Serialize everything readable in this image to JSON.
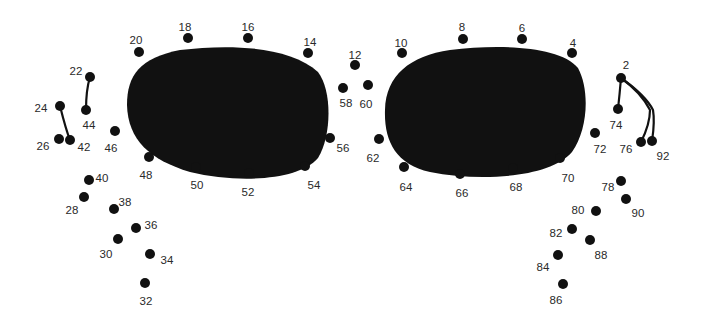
{
  "puzzle": {
    "type": "connect-the-dots",
    "colors": {
      "background": "#ffffff",
      "ink": "#111111",
      "label": "#2a2a2a"
    },
    "lenses": [
      {
        "name": "left-lens",
        "path": "M 180 50 C 230 44, 290 46, 318 72 C 332 90, 332 135, 318 158 C 300 180, 240 184, 190 172 C 150 160, 128 140, 127 105 C 127 75, 140 58, 180 50 Z"
      },
      {
        "name": "right-lens",
        "path": "M 450 50 C 500 44, 560 46, 578 68 C 590 90, 588 130, 572 152 C 550 178, 480 182, 430 172 C 395 164, 384 140, 385 110 C 386 75, 410 56, 450 50 Z"
      }
    ],
    "lines": [
      {
        "name": "line-22-44",
        "d": "M 90 77 C 86 90, 86 100, 86 110"
      },
      {
        "name": "line-24-42",
        "d": "M 60 106 C 63 118, 66 130, 70 140"
      },
      {
        "name": "line-2-74",
        "d": "M 621 78 C 620 90, 619 100, 618 109"
      },
      {
        "name": "line-2-76",
        "d": "M 621 78 C 635 88, 645 100, 650 110 C 650 122, 645 134, 641 142"
      },
      {
        "name": "line-2-92",
        "d": "M 621 78 C 635 88, 648 100, 653 110 C 655 122, 653 134, 652 141"
      }
    ],
    "dots": [
      {
        "n": "2",
        "x": 621,
        "y": 78,
        "lx": 626,
        "ly": 66
      },
      {
        "n": "4",
        "x": 572,
        "y": 53,
        "lx": 573,
        "ly": 44
      },
      {
        "n": "6",
        "x": 522,
        "y": 39,
        "lx": 522,
        "ly": 29
      },
      {
        "n": "8",
        "x": 463,
        "y": 39,
        "lx": 462,
        "ly": 28
      },
      {
        "n": "10",
        "x": 402,
        "y": 53,
        "lx": 401,
        "ly": 44
      },
      {
        "n": "12",
        "x": 355,
        "y": 65,
        "lx": 355,
        "ly": 56
      },
      {
        "n": "14",
        "x": 308,
        "y": 53,
        "lx": 310,
        "ly": 43
      },
      {
        "n": "16",
        "x": 248,
        "y": 38,
        "lx": 248,
        "ly": 28
      },
      {
        "n": "18",
        "x": 188,
        "y": 38,
        "lx": 185,
        "ly": 28
      },
      {
        "n": "20",
        "x": 139,
        "y": 52,
        "lx": 136,
        "ly": 41
      },
      {
        "n": "22",
        "x": 90,
        "y": 77,
        "lx": 76,
        "ly": 72
      },
      {
        "n": "24",
        "x": 60,
        "y": 106,
        "lx": 41,
        "ly": 109
      },
      {
        "n": "26",
        "x": 59,
        "y": 139,
        "lx": 43,
        "ly": 147
      },
      {
        "n": "28",
        "x": 84,
        "y": 197,
        "lx": 72,
        "ly": 211
      },
      {
        "n": "30",
        "x": 118,
        "y": 239,
        "lx": 106,
        "ly": 255
      },
      {
        "n": "32",
        "x": 145,
        "y": 283,
        "lx": 146,
        "ly": 302
      },
      {
        "n": "34",
        "x": 150,
        "y": 254,
        "lx": 167,
        "ly": 261
      },
      {
        "n": "36",
        "x": 136,
        "y": 228,
        "lx": 151,
        "ly": 226
      },
      {
        "n": "38",
        "x": 114,
        "y": 209,
        "lx": 125,
        "ly": 203
      },
      {
        "n": "40",
        "x": 89,
        "y": 180,
        "lx": 102,
        "ly": 179
      },
      {
        "n": "42",
        "x": 70,
        "y": 140,
        "lx": 84,
        "ly": 148
      },
      {
        "n": "44",
        "x": 86,
        "y": 110,
        "lx": 89,
        "ly": 126
      },
      {
        "n": "46",
        "x": 115,
        "y": 131,
        "lx": 111,
        "ly": 149
      },
      {
        "n": "48",
        "x": 149,
        "y": 157,
        "lx": 146,
        "ly": 176
      },
      {
        "n": "50",
        "x": 196,
        "y": 167,
        "lx": 197,
        "ly": 186
      },
      {
        "n": "52",
        "x": 249,
        "y": 173,
        "lx": 248,
        "ly": 193
      },
      {
        "n": "54",
        "x": 305,
        "y": 166,
        "lx": 314,
        "ly": 186
      },
      {
        "n": "56",
        "x": 330,
        "y": 138,
        "lx": 343,
        "ly": 149
      },
      {
        "n": "58",
        "x": 343,
        "y": 88,
        "lx": 346,
        "ly": 104
      },
      {
        "n": "60",
        "x": 368,
        "y": 85,
        "lx": 366,
        "ly": 105
      },
      {
        "n": "62",
        "x": 379,
        "y": 139,
        "lx": 373,
        "ly": 159
      },
      {
        "n": "64",
        "x": 404,
        "y": 167,
        "lx": 406,
        "ly": 188
      },
      {
        "n": "66",
        "x": 460,
        "y": 174,
        "lx": 462,
        "ly": 194
      },
      {
        "n": "68",
        "x": 513,
        "y": 168,
        "lx": 516,
        "ly": 188
      },
      {
        "n": "70",
        "x": 560,
        "y": 158,
        "lx": 568,
        "ly": 179
      },
      {
        "n": "72",
        "x": 595,
        "y": 133,
        "lx": 600,
        "ly": 150
      },
      {
        "n": "74",
        "x": 618,
        "y": 109,
        "lx": 616,
        "ly": 126
      },
      {
        "n": "76",
        "x": 641,
        "y": 142,
        "lx": 626,
        "ly": 150
      },
      {
        "n": "78",
        "x": 621,
        "y": 181,
        "lx": 608,
        "ly": 188
      },
      {
        "n": "80",
        "x": 596,
        "y": 211,
        "lx": 578,
        "ly": 211
      },
      {
        "n": "82",
        "x": 572,
        "y": 229,
        "lx": 556,
        "ly": 234
      },
      {
        "n": "84",
        "x": 558,
        "y": 255,
        "lx": 543,
        "ly": 268
      },
      {
        "n": "86",
        "x": 563,
        "y": 284,
        "lx": 556,
        "ly": 301
      },
      {
        "n": "88",
        "x": 590,
        "y": 240,
        "lx": 601,
        "ly": 256
      },
      {
        "n": "90",
        "x": 626,
        "y": 199,
        "lx": 638,
        "ly": 214
      },
      {
        "n": "92",
        "x": 652,
        "y": 141,
        "lx": 663,
        "ly": 157
      }
    ]
  }
}
